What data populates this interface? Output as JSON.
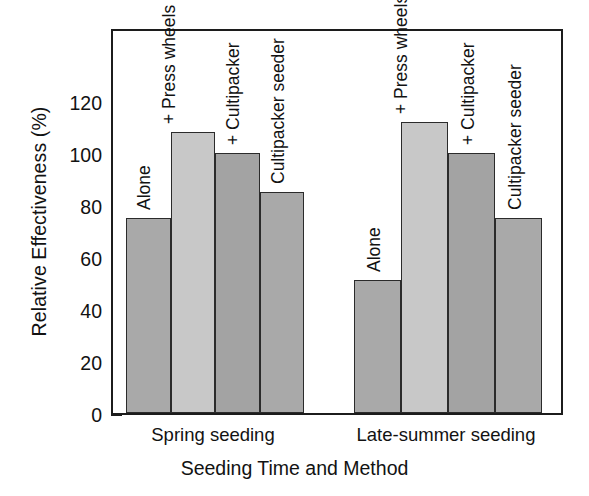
{
  "chart_data": {
    "type": "bar",
    "title": "",
    "subtitle": "",
    "xlabel": "Seeding Time and Method",
    "ylabel": "Relative Effectiveness (%)",
    "ylim": [
      0,
      132
    ],
    "yticks": [
      0,
      20,
      40,
      60,
      80,
      100,
      120
    ],
    "ytick_labels": [
      "0",
      "20",
      "40",
      "60",
      "80",
      "100",
      "120"
    ],
    "grid": false,
    "legend": "none",
    "categories": [
      "Spring seeding",
      "Late-summer seeding"
    ],
    "bar_labels": [
      "Alone",
      "+ Press wheels",
      "+ Cultipacker",
      "Cultipacker seeder"
    ],
    "series": [
      {
        "name": "Alone",
        "values": [
          75,
          51
        ],
        "color": "#a9a9a9"
      },
      {
        "name": "+ Press wheels",
        "values": [
          108,
          112
        ],
        "color": "#c8c8c8"
      },
      {
        "name": "+ Cultipacker",
        "values": [
          100,
          100
        ],
        "color": "#a3a3a3"
      },
      {
        "name": "Cultipacker seeder",
        "values": [
          85,
          75
        ],
        "color": "#a9a9a9"
      }
    ],
    "bars": [
      {
        "group": "Spring seeding",
        "method": "Alone",
        "value": 75,
        "color": "#a9a9a9"
      },
      {
        "group": "Spring seeding",
        "method": "+ Press wheels",
        "value": 108,
        "color": "#c8c8c8"
      },
      {
        "group": "Spring seeding",
        "method": "+ Cultipacker",
        "value": 100,
        "color": "#a3a3a3"
      },
      {
        "group": "Spring seeding",
        "method": "Cultipacker seeder",
        "value": 85,
        "color": "#a9a9a9"
      },
      {
        "group": "Late-summer seeding",
        "method": "Alone",
        "value": 51,
        "color": "#a9a9a9"
      },
      {
        "group": "Late-summer seeding",
        "method": "+ Press wheels",
        "value": 112,
        "color": "#c8c8c8"
      },
      {
        "group": "Late-summer seeding",
        "method": "+ Cultipacker",
        "value": 100,
        "color": "#a3a3a3"
      },
      {
        "group": "Late-summer seeding",
        "method": "Cultipacker seeder",
        "value": 75,
        "color": "#a9a9a9"
      }
    ]
  },
  "axis": {
    "y_title": "Relative Effectiveness (%)",
    "x_title": "Seeding Time and Method",
    "ticks": [
      {
        "value": 120,
        "label": "120"
      },
      {
        "value": 100,
        "label": "100"
      },
      {
        "value": 80,
        "label": "80"
      },
      {
        "value": 60,
        "label": "60"
      },
      {
        "value": 40,
        "label": "40"
      },
      {
        "value": 20,
        "label": "20"
      },
      {
        "value": 0,
        "label": "0"
      }
    ]
  },
  "groups": [
    {
      "label": "Spring seeding"
    },
    {
      "label": "Late-summer seeding"
    }
  ],
  "labels": {
    "alone_1": "Alone",
    "press_wheels_1": "+ Press wheels",
    "cultipacker_1": "+ Cultipacker",
    "cultipacker_seeder_1": "Cultipacker seeder",
    "alone_2": "Alone",
    "press_wheels_2": "+ Press wheels",
    "cultipacker_2": "+ Cultipacker",
    "cultipacker_seeder_2": "Cultipacker seeder"
  },
  "colors": {
    "bar_dark": "#a9a9a9",
    "bar_light": "#c8c8c8",
    "bar_mid": "#a3a3a3",
    "axis": "#1c1c1c",
    "text": "#121212",
    "background": "#ffffff"
  }
}
